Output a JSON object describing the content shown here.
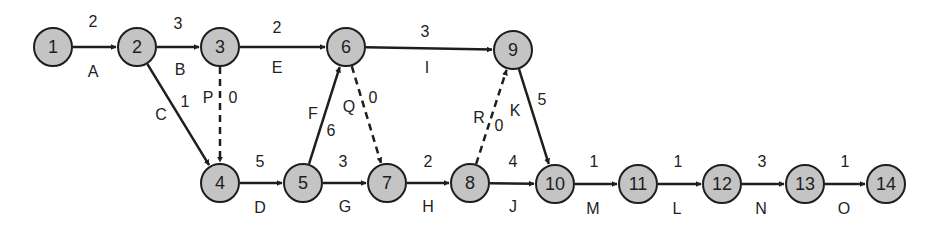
{
  "diagram": {
    "type": "activity-on-arrow network",
    "nodes": [
      {
        "id": "1",
        "x": 53,
        "y": 47
      },
      {
        "id": "2",
        "x": 137,
        "y": 47
      },
      {
        "id": "3",
        "x": 220,
        "y": 47
      },
      {
        "id": "4",
        "x": 220,
        "y": 183
      },
      {
        "id": "5",
        "x": 303,
        "y": 183
      },
      {
        "id": "6",
        "x": 346,
        "y": 47
      },
      {
        "id": "7",
        "x": 387,
        "y": 183
      },
      {
        "id": "8",
        "x": 470,
        "y": 183
      },
      {
        "id": "9",
        "x": 513,
        "y": 50
      },
      {
        "id": "10",
        "x": 555,
        "y": 184
      },
      {
        "id": "11",
        "x": 638,
        "y": 184
      },
      {
        "id": "12",
        "x": 722,
        "y": 184
      },
      {
        "id": "13",
        "x": 805,
        "y": 184
      },
      {
        "id": "14",
        "x": 886,
        "y": 184
      }
    ],
    "edges": [
      {
        "from": "1",
        "to": "2",
        "activity": "A",
        "duration": "2",
        "dashed": false,
        "al": [
          93,
          72
        ],
        "dl": [
          93,
          22
        ]
      },
      {
        "from": "2",
        "to": "3",
        "activity": "B",
        "duration": "3",
        "dashed": false,
        "al": [
          180,
          70
        ],
        "dl": [
          178,
          24
        ]
      },
      {
        "from": "3",
        "to": "6",
        "activity": "E",
        "duration": "2",
        "dashed": false,
        "al": [
          277,
          68
        ],
        "dl": [
          277,
          28
        ]
      },
      {
        "from": "2",
        "to": "4",
        "activity": "C",
        "duration": "1",
        "dashed": false,
        "al": [
          161,
          115
        ],
        "dl": [
          185,
          102
        ]
      },
      {
        "from": "3",
        "to": "4",
        "activity": "P",
        "duration": "0",
        "dashed": true,
        "al": [
          208,
          98
        ],
        "dl": [
          233,
          98
        ]
      },
      {
        "from": "6",
        "to": "9",
        "activity": "I",
        "duration": "3",
        "dashed": false,
        "al": [
          427,
          68
        ],
        "dl": [
          425,
          32
        ]
      },
      {
        "from": "4",
        "to": "5",
        "activity": "D",
        "duration": "5",
        "dashed": false,
        "al": [
          260,
          208
        ],
        "dl": [
          260,
          162
        ]
      },
      {
        "from": "5",
        "to": "6",
        "activity": "F",
        "duration": "6",
        "dashed": false,
        "al": [
          313,
          114
        ],
        "dl": [
          331,
          131
        ]
      },
      {
        "from": "6",
        "to": "7",
        "activity": "Q",
        "duration": "0",
        "dashed": true,
        "al": [
          349,
          107
        ],
        "dl": [
          373,
          98
        ]
      },
      {
        "from": "5",
        "to": "7",
        "activity": "G",
        "duration": "3",
        "dashed": false,
        "al": [
          345,
          207
        ],
        "dl": [
          343,
          162
        ]
      },
      {
        "from": "7",
        "to": "8",
        "activity": "H",
        "duration": "2",
        "dashed": false,
        "al": [
          428,
          207
        ],
        "dl": [
          428,
          162
        ]
      },
      {
        "from": "8",
        "to": "9",
        "activity": "R",
        "duration": "0",
        "dashed": true,
        "al": [
          479,
          118
        ],
        "dl": [
          499,
          126
        ]
      },
      {
        "from": "9",
        "to": "10",
        "activity": "K",
        "duration": "5",
        "dashed": false,
        "al": [
          515,
          111
        ],
        "dl": [
          542,
          100
        ]
      },
      {
        "from": "8",
        "to": "10",
        "activity": "J",
        "duration": "4",
        "dashed": false,
        "al": [
          513,
          207
        ],
        "dl": [
          513,
          162
        ]
      },
      {
        "from": "10",
        "to": "11",
        "activity": "M",
        "duration": "1",
        "dashed": false,
        "al": [
          593,
          209
        ],
        "dl": [
          594,
          162
        ]
      },
      {
        "from": "11",
        "to": "12",
        "activity": "L",
        "duration": "1",
        "dashed": false,
        "al": [
          677,
          209
        ],
        "dl": [
          678,
          162
        ]
      },
      {
        "from": "12",
        "to": "13",
        "activity": "N",
        "duration": "3",
        "dashed": false,
        "al": [
          761,
          209
        ],
        "dl": [
          762,
          162
        ]
      },
      {
        "from": "13",
        "to": "14",
        "activity": "O",
        "duration": "1",
        "dashed": false,
        "al": [
          844,
          209
        ],
        "dl": [
          845,
          162
        ]
      }
    ],
    "colors": {
      "node_fill": "#c4c4c4",
      "stroke": "#1e1e1e"
    }
  }
}
